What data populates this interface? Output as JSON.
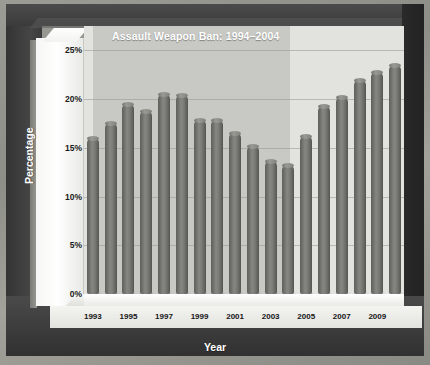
{
  "chart_data": {
    "type": "bar",
    "title": "Assault Weapon Ban: 1994–2004",
    "xlabel": "Year",
    "ylabel": "Percentage",
    "ylim": [
      0,
      27.5
    ],
    "ytick_values": [
      0,
      5,
      10,
      15,
      20,
      25
    ],
    "ytick_labels": [
      "0%",
      "5%",
      "10%",
      "15%",
      "20%",
      "25%"
    ],
    "grid": true,
    "legend": "none",
    "categories": [
      1993,
      1994,
      1995,
      1996,
      1997,
      1998,
      1999,
      2000,
      2001,
      2002,
      2003,
      2004,
      2005,
      2006,
      2007,
      2008,
      2009,
      2010
    ],
    "xtick_labels": [
      "1993",
      "",
      "1995",
      "",
      "1997",
      "",
      "1999",
      "",
      "2001",
      "",
      "2003",
      "",
      "2005",
      "",
      "2007",
      "",
      "2009",
      ""
    ],
    "values": [
      16.0,
      17.5,
      19.5,
      18.8,
      20.5,
      20.4,
      17.9,
      17.9,
      16.5,
      15.2,
      13.6,
      13.2,
      16.2,
      19.3,
      20.2,
      22.0,
      22.8,
      23.5
    ],
    "annotations": [
      {
        "type": "shaded-band",
        "label": "Assault Weapon Ban: 1994–2004",
        "start_category": 1994,
        "end_category": 2004,
        "color": "#8c8c87"
      }
    ],
    "series_color": "#7c7c78",
    "plot_background": "#e2e2de",
    "frame_color": "#3c3c3c"
  }
}
